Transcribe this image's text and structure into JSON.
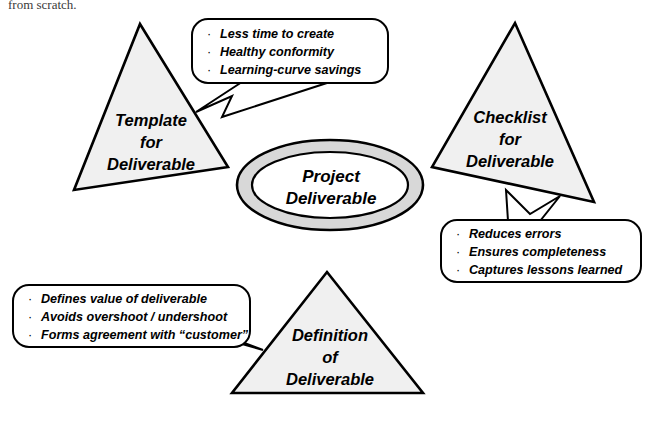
{
  "page": {
    "cut_off_line": "from scratch.",
    "background_color": "#ffffff",
    "shape_fill_color": "#f0f0f0",
    "ring_fill_color": "#d8d8d8",
    "outline_color": "#000000"
  },
  "center": {
    "name": "project-deliverable",
    "line1": "Project",
    "line2": "Deliverable"
  },
  "nodes": [
    {
      "id": "template",
      "line1": "Template",
      "line2": "for",
      "line3": "Deliverable"
    },
    {
      "id": "checklist",
      "line1": "Checklist",
      "line2": "for",
      "line3": "Deliverable"
    },
    {
      "id": "definition",
      "line1": "Definition",
      "line2": "of",
      "line3": "Deliverable"
    }
  ],
  "callouts": [
    {
      "id": "template-benefits",
      "bullets": [
        "Less time to create",
        "Healthy conformity",
        "Learning-curve savings"
      ]
    },
    {
      "id": "checklist-benefits",
      "bullets": [
        "Reduces errors",
        "Ensures completeness",
        "Captures lessons learned"
      ]
    },
    {
      "id": "definition-benefits",
      "bullets": [
        "Defines value of deliverable",
        "Avoids overshoot / undershoot",
        "Forms agreement with “customer”"
      ]
    }
  ],
  "bullet_glyph": "·"
}
